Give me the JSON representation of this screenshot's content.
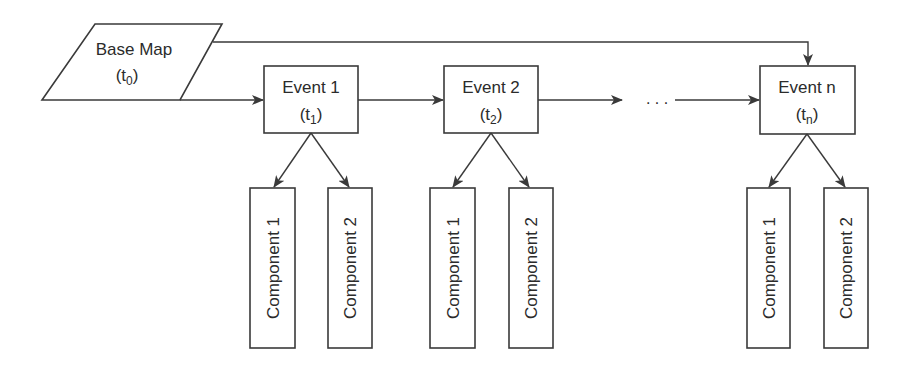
{
  "diagram": {
    "type": "flowchart",
    "colors": {
      "stroke": "#3a3a3a",
      "text": "#2b2b2b",
      "background": "#ffffff"
    },
    "base_map": {
      "title": "Base Map",
      "time_open": "(t",
      "time_sub": "0",
      "time_close": ")"
    },
    "ellipsis": ". . .",
    "events": [
      {
        "title": "Event 1",
        "time_open": "(t",
        "time_sub": "1",
        "time_close": ")",
        "components": [
          "Component 1",
          "Component 2"
        ]
      },
      {
        "title": "Event 2",
        "time_open": "(t",
        "time_sub": "2",
        "time_close": ")",
        "components": [
          "Component 1",
          "Component 2"
        ]
      },
      {
        "title": "Event n",
        "time_open": "(t",
        "time_sub": "n",
        "time_close": ")",
        "components": [
          "Component 1",
          "Component 2"
        ]
      }
    ],
    "edges": [
      {
        "from": "Base Map",
        "to": "Event 1"
      },
      {
        "from": "Base Map",
        "to": "Event n"
      },
      {
        "from": "Event 1",
        "to": "Event 2"
      },
      {
        "from": "Event 2",
        "to": "..."
      },
      {
        "from": "...",
        "to": "Event n"
      },
      {
        "from": "Event 1",
        "to": "Component 1"
      },
      {
        "from": "Event 1",
        "to": "Component 2"
      },
      {
        "from": "Event 2",
        "to": "Component 1"
      },
      {
        "from": "Event 2",
        "to": "Component 2"
      },
      {
        "from": "Event n",
        "to": "Component 1"
      },
      {
        "from": "Event n",
        "to": "Component 2"
      }
    ]
  }
}
